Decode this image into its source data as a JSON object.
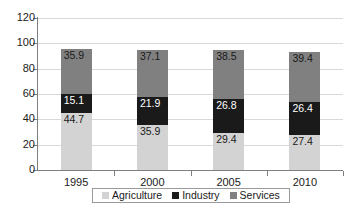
{
  "chart_data": {
    "type": "bar",
    "subtype": "stacked-column",
    "title": "",
    "subtitle": "",
    "xlabel": "",
    "ylabel": "",
    "categories": [
      "1995",
      "2000",
      "2005",
      "2010"
    ],
    "series": [
      {
        "name": "Agriculture",
        "color": "#d3d3d3",
        "label_color": "#1a1a1a",
        "values": [
          44.7,
          35.9,
          29.4,
          27.4
        ]
      },
      {
        "name": "Industry",
        "color": "#1a1a1a",
        "label_color": "#ffffff",
        "values": [
          15.1,
          21.9,
          26.8,
          26.4
        ]
      },
      {
        "name": "Services",
        "color": "#808080",
        "label_color": "#1a1a1a",
        "values": [
          35.9,
          37.1,
          38.5,
          39.4
        ]
      }
    ],
    "stack_totals": [
      95.7,
      94.9,
      94.7,
      93.2
    ],
    "ylim": [
      0,
      120
    ],
    "yticks": [
      0,
      20,
      40,
      60,
      80,
      100,
      120
    ],
    "ytick_labels": [
      "0",
      "20",
      "40",
      "60",
      "80",
      "100",
      "120"
    ],
    "grid": true,
    "grid_axis": "y",
    "grid_color": "#d9d9d9",
    "axis_color": "#7f7f7f",
    "legend_position": "bottom",
    "data_labels": true
  },
  "legend": {
    "items": [
      {
        "label": "Agriculture",
        "color": "#d3d3d3"
      },
      {
        "label": "Industry",
        "color": "#1a1a1a"
      },
      {
        "label": "Services",
        "color": "#808080"
      }
    ]
  }
}
